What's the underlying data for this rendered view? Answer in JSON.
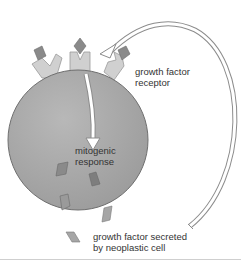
{
  "diagram": {
    "labels": {
      "receptor": [
        "growth factor",
        "receptor"
      ],
      "response": [
        "mitogenic",
        "response"
      ],
      "secreted": [
        "growth factor secreted",
        "by neoplastic cell"
      ]
    },
    "colors": {
      "cell_fill": "#a9a9a9",
      "cell_edge": "#6f6f6f",
      "receptor_fill": "#d0d0d0",
      "growth_factor_fill": "#8a8a8a",
      "growth_factor_light": "#a6a6a6",
      "arrow_outline": "#8c8c8c",
      "text": "#333333"
    },
    "elements": [
      {
        "type": "cell",
        "shape": "circle"
      },
      {
        "type": "receptor",
        "count": 3
      },
      {
        "type": "growth-factor",
        "count": 8
      },
      {
        "type": "arrow",
        "name": "signal-arrow",
        "direction": "down"
      },
      {
        "type": "arrow",
        "name": "secretion-loop-arrow",
        "direction": "curved-back-to-receptor"
      }
    ]
  }
}
